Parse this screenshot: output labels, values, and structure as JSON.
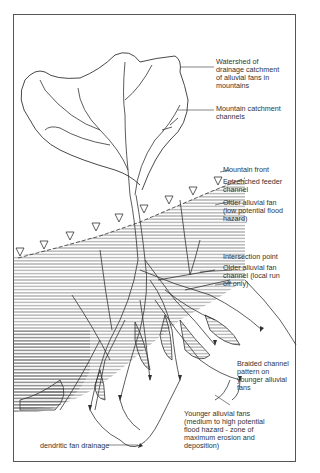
{
  "diagram": {
    "type": "alluvial fan hydrology sketch",
    "labels": {
      "watershed": "Watershed of\ndrainage catchment\nof alluvial fans in\nmountains",
      "mountain_channels": "Mountain catchment\nchannels",
      "mountain_front": "Mountain front",
      "entrenched": "Entrenched feeder\nchannel",
      "older_fan": "Older alluvial fan\n(low potential flood\nhazard)",
      "intersection": "Intersection point",
      "older_channel": "Older alluvial fan\nchannel (local run\noff only)",
      "braided": "Braided channel\npattern on\nyounger alluvial\nfans",
      "younger_fan": "Younger alluvial fans\n(medium to high potential\nflood hazard - zone of\nmaximum erosion and\ndeposition)",
      "dendritic": "dendritic fan drainage"
    },
    "colors": {
      "line": "#333333",
      "hatch": "#555555",
      "background": "#ffffff"
    }
  }
}
